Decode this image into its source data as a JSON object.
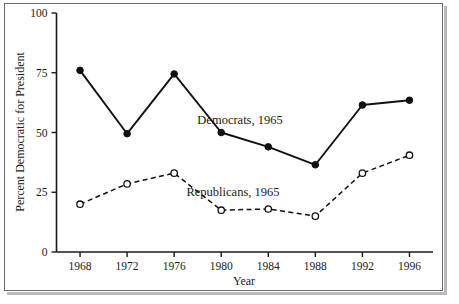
{
  "chart_data": {
    "type": "line",
    "title": "",
    "xlabel": "Year",
    "ylabel": "Percent Democratic for President",
    "categories": [
      "1968",
      "1972",
      "1976",
      "1980",
      "1984",
      "1988",
      "1992",
      "1996"
    ],
    "x": [
      1968,
      1972,
      1976,
      1980,
      1984,
      1988,
      1992,
      1996
    ],
    "xlim": [
      1966,
      1998
    ],
    "ylim": [
      0,
      100
    ],
    "yticks": [
      0,
      25,
      50,
      75,
      100
    ],
    "ytick_labels": [
      "0",
      "25",
      "50",
      "75",
      "100"
    ],
    "xtick_labels": [
      "1968",
      "1972",
      "1976",
      "1980",
      "1984",
      "1988",
      "1992",
      "1996"
    ],
    "grid": false,
    "legend_position": "inline-annotation",
    "series": [
      {
        "name": "Democrats, 1965",
        "marker": "filled-circle",
        "line_style": "solid",
        "values": [
          76,
          49.5,
          74.5,
          50,
          44,
          36.5,
          61.5,
          63.5
        ]
      },
      {
        "name": "Republicans, 1965",
        "marker": "open-circle",
        "line_style": "dashed",
        "values": [
          20,
          28.5,
          33,
          17.5,
          18,
          15,
          33,
          40.5
        ]
      }
    ],
    "annotations": [
      {
        "text": "Democrats, 1965",
        "x": 1981.6,
        "y": 53.5
      },
      {
        "text": "Republicans, 1965",
        "x": 1981.0,
        "y": 23.5
      }
    ]
  },
  "colors": {
    "line": "#111111",
    "axis": "#1a1a1a",
    "frame": "#6b6b6b",
    "background": "#ffffff"
  }
}
